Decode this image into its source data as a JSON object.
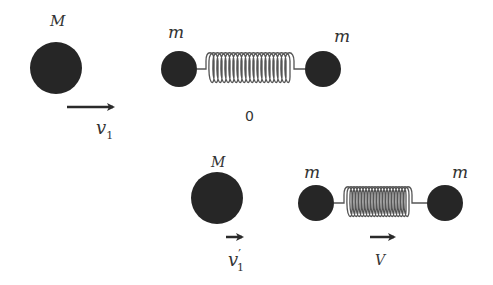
{
  "colors": {
    "ball": "#262626",
    "spring": "#555555",
    "arrow": "#2a2a2a",
    "text": "#333333"
  },
  "before": {
    "big_mass_label": "M",
    "big_velocity_label": "v",
    "big_velocity_sub": "1",
    "left_mass_label": "m",
    "right_mass_label": "m",
    "state_label": "0"
  },
  "after": {
    "big_mass_label": "M",
    "big_velocity_label": "v",
    "big_velocity_prime": "′",
    "big_velocity_sub": "1",
    "left_mass_label": "m",
    "right_mass_label": "m",
    "system_velocity_label": "V"
  }
}
